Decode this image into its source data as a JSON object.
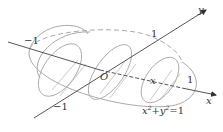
{
  "figure": {
    "type": "3d-solid-with-cross-sections",
    "axes": {
      "x": {
        "label": "x",
        "ticks": [
          "1"
        ]
      },
      "y": {
        "label": "y",
        "ticks": [
          "1",
          "-1"
        ]
      },
      "z_like_axis": {
        "ticks": [
          "-1"
        ]
      }
    },
    "origin_label": "O",
    "section_label": "x",
    "base_equation": {
      "x_base": "x",
      "exp1": "2",
      "plus": "+y",
      "exp2": "2",
      "rhs": "=1"
    },
    "labels": {
      "neg_one_left": "−1",
      "neg_one_bottom": "−1",
      "one_top": "1",
      "one_right": "1",
      "y_axis": "y",
      "x_axis": "x",
      "origin": "O",
      "section_x": "x"
    },
    "colors": {
      "axis": "#555555",
      "curve": "#aaaaaa",
      "hatch": "#bbbbbb",
      "text": "#333333"
    }
  }
}
